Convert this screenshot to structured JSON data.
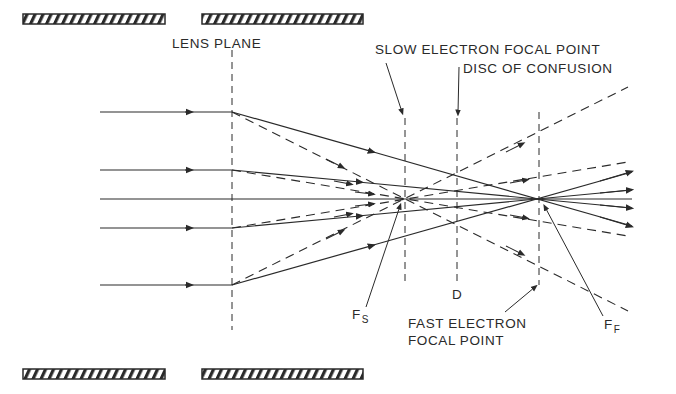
{
  "diagram": {
    "labels": {
      "lens_plane": "LENS PLANE",
      "slow_focal_point": "SLOW ELECTRON FOCAL POINT",
      "disc_of_confusion": "DISC OF CONFUSION",
      "d": "D",
      "fs_main": "F",
      "fs_sub": "S",
      "fast_focal_line1": "FAST ELECTRON",
      "fast_focal_line2": "FOCAL POINT",
      "ff_main": "F",
      "ff_sub": "F"
    },
    "colors": {
      "ink": "#2a2a2a",
      "background": "#ffffff"
    },
    "geometry": {
      "lens_plane_x": 232,
      "slow_focus_x": 405,
      "disc_x": 457,
      "fast_focus_x": 539,
      "axis_y": 199,
      "ray_heights": [
        112,
        170,
        199,
        228,
        285
      ]
    }
  }
}
